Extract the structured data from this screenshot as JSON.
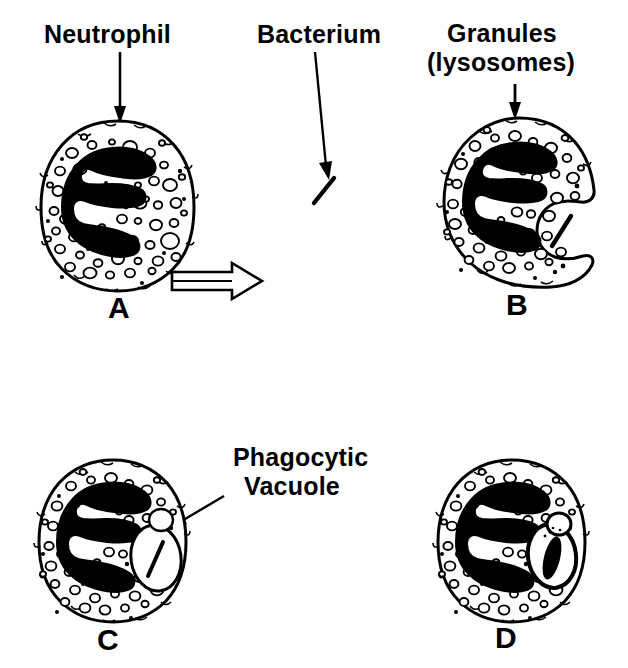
{
  "figure": {
    "kind": "scientific-line-diagram",
    "background_color": "#ffffff",
    "ink_color": "#000000",
    "width": 628,
    "height": 668
  },
  "labels": {
    "neutrophil": "Neutrophil",
    "bacterium": "Bacterium",
    "granules_line1": "Granules",
    "granules_line2": "(lysosomes)",
    "phagocytic_line1": "Phagocytic",
    "phagocytic_line2": "Vacuole"
  },
  "panels": [
    {
      "id": "A",
      "letter": "A",
      "caption": "Neutrophil with multilobed nucleus and cytoplasmic granules",
      "cell_center": [
        118,
        205
      ],
      "cell_radius": [
        72,
        82
      ],
      "granule_count": 62,
      "has_bacterium": false,
      "has_vacuole": false,
      "has_pseudopods": false
    },
    {
      "id": "B",
      "letter": "B",
      "caption": "Pseudopods extend around the bacterium during engulfment",
      "cell_center": [
        519,
        200
      ],
      "cell_radius": [
        72,
        80
      ],
      "granule_count": 62,
      "has_bacterium": true,
      "has_vacuole": false,
      "has_pseudopods": true
    },
    {
      "id": "C",
      "letter": "C",
      "caption": "Bacterium enclosed within a phagocytic vacuole",
      "cell_center": [
        113,
        540
      ],
      "cell_radius": [
        70,
        78
      ],
      "granule_count": 62,
      "has_bacterium": true,
      "has_vacuole": true,
      "has_pseudopods": false
    },
    {
      "id": "D",
      "letter": "D",
      "caption": "Granules fuse with the vacuole and the bacterium is digested",
      "cell_center": [
        512,
        540
      ],
      "cell_radius": [
        70,
        78
      ],
      "granule_count": 62,
      "has_bacterium": true,
      "has_vacuole": true,
      "has_pseudopods": false,
      "granule_fusing": true,
      "bacterium_degraded": true
    }
  ],
  "annotations": [
    {
      "name": "neutrophil-pointer",
      "style": "straight-down-arrow",
      "from": [
        120,
        52
      ],
      "to": [
        120,
        120
      ]
    },
    {
      "name": "bacterium-pointer",
      "style": "long-slanted-arrow",
      "from": [
        315,
        52
      ],
      "to": [
        330,
        175
      ]
    },
    {
      "name": "granules-pointer",
      "style": "short-down-arrow",
      "from": [
        515,
        85
      ],
      "to": [
        515,
        116
      ]
    },
    {
      "name": "phagocytic-vacuole-pointer",
      "style": "diagonal-arrow-down-left",
      "from": [
        222,
        498
      ],
      "to": [
        172,
        528
      ]
    },
    {
      "name": "process-arrow",
      "style": "hollow-block-arrow-right",
      "from": [
        172,
        281
      ],
      "to": [
        258,
        281
      ]
    }
  ],
  "panel_letter_positions": {
    "A": [
      108,
      293
    ],
    "B": [
      506,
      290
    ],
    "C": [
      97,
      624
    ],
    "D": [
      495,
      622
    ]
  }
}
